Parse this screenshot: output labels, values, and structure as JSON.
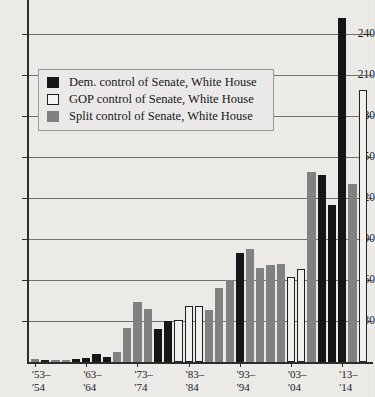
{
  "legend": {
    "position": "inside-top-left",
    "items": [
      {
        "key": "dem",
        "label": "Dem. control of Senate, White House",
        "color": "#131315"
      },
      {
        "key": "gop",
        "label": "GOP control of Senate, White House",
        "color": "#ffffff"
      },
      {
        "key": "split",
        "label": "Split control of Senate, White House",
        "color": "#818181"
      }
    ]
  },
  "axis": {
    "y_ticks": [
      30,
      60,
      90,
      120,
      150,
      180,
      210,
      240
    ],
    "y_tick_labels": [
      "30",
      "60",
      "90",
      "120",
      "150",
      "180",
      "210",
      "240"
    ],
    "x_tick_labels": [
      "'53–\n'54",
      "'63–\n'64",
      "'73–\n'74",
      "'83–\n'84",
      "'93–\n'94",
      "'03–\n'04",
      "'13–\n'14"
    ]
  },
  "chart_data": {
    "type": "bar",
    "title": "",
    "subtitle": "",
    "xlabel": "",
    "ylabel": "",
    "ylim": [
      0,
      255
    ],
    "grid": true,
    "legend_position": "inside-top-left",
    "group_labels": [
      "'53–'54",
      "'63–'64",
      "'73–'74",
      "'83–'84",
      "'93–'94",
      "'03–'04",
      "'13–'14"
    ],
    "categories": [
      "'53–'54",
      "'55–'56",
      "'57–'58",
      "'59–'60",
      "'61–'62",
      "'63–'64",
      "'65–'66",
      "'67–'68",
      "'69–'70",
      "'71–'72",
      "'73–'74",
      "'75–'76",
      "'77–'78",
      "'79–'80",
      "'81–'82",
      "'83–'84",
      "'85–'86",
      "'87–'88",
      "'89–'90",
      "'91–'92",
      "'93–'94",
      "'95–'96",
      "'97–'98",
      "'99–'00",
      "'01–'02",
      "'03–'04",
      "'05–'06",
      "'07–'08",
      "'09–'10",
      "'11–'12",
      "'13–'14"
    ],
    "values": [
      2,
      0,
      0,
      0,
      2,
      3,
      6,
      4,
      7,
      25,
      44,
      39,
      24,
      30,
      31,
      41,
      41,
      38,
      54,
      60,
      80,
      83,
      69,
      71,
      72,
      62,
      68,
      139,
      137,
      115,
      252
    ],
    "control": [
      "split",
      "gop",
      "split",
      "split",
      "dem",
      "dem",
      "dem",
      "dem",
      "split",
      "split",
      "split",
      "split",
      "dem",
      "dem",
      "gop",
      "gop",
      "gop",
      "split",
      "split",
      "split",
      "dem",
      "split",
      "split",
      "split",
      "split",
      "gop",
      "gop",
      "split",
      "dem",
      "dem",
      "dem"
    ],
    "extra_bars": [
      {
        "category": "'13–'14 split",
        "value": 130,
        "control": "split"
      },
      {
        "category": "'13–'14 gop",
        "value": 199,
        "control": "gop"
      }
    ],
    "series": [
      {
        "name": "Dem. control of Senate, White House",
        "color": "#131315"
      },
      {
        "name": "GOP control of Senate, White House",
        "color": "#ffffff"
      },
      {
        "name": "Split control of Senate, White House",
        "color": "#818181"
      }
    ]
  }
}
